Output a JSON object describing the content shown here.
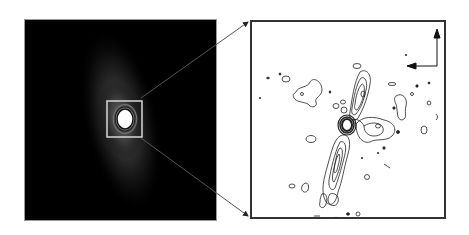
{
  "figure": {
    "left_panel": {
      "description": "greyscale image with bright central source and diffuse elongated emission",
      "background_color": "#000000",
      "zoom_box_color": "#d8d8d8"
    },
    "right_panel": {
      "description": "contour map of zoomed region",
      "background_color": "#ffffff",
      "contour_color": "#222222",
      "compass": {
        "up_arrow": "N",
        "left_arrow": "E"
      }
    },
    "connector_lines_color": "#333333"
  }
}
